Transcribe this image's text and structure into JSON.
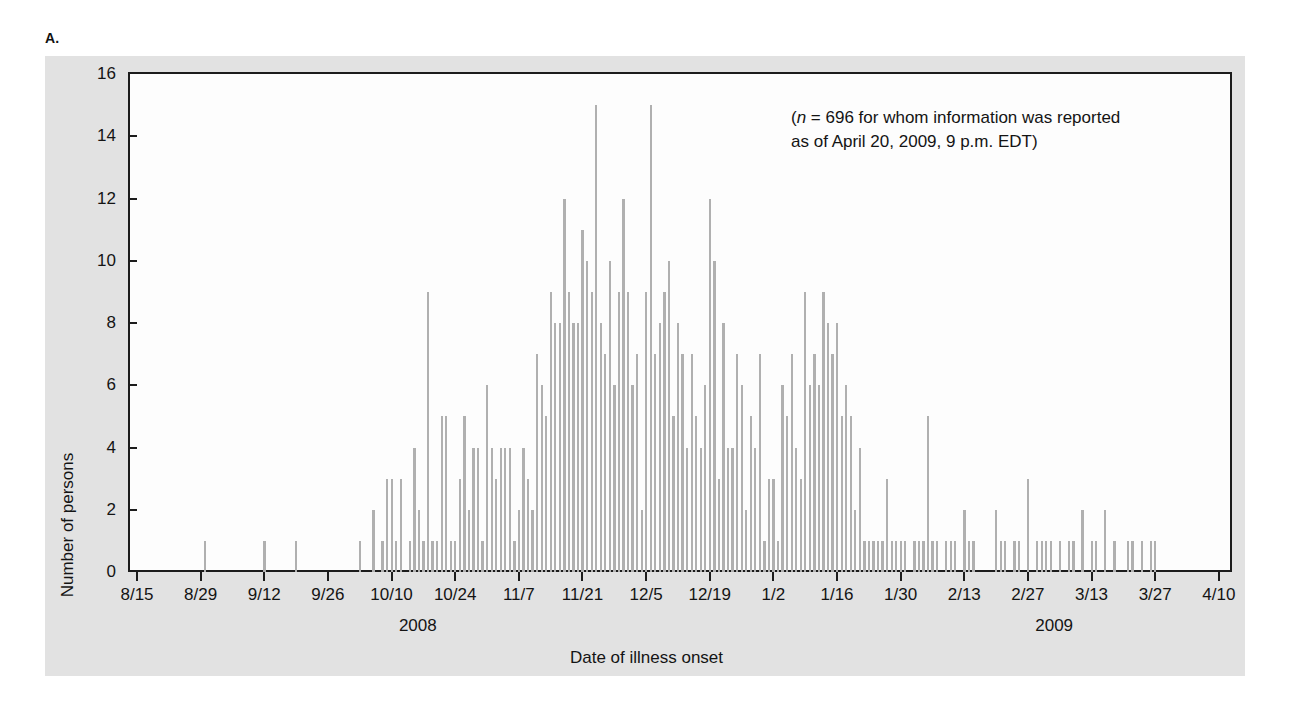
{
  "figure": {
    "panel_letter": "A.",
    "annotation_line1_prefix": "(",
    "annotation_n_symbol": "n",
    "annotation_line1_rest": " = 696 for whom information was reported",
    "annotation_line2": "as of April 20, 2009, 9 p.m. EDT)",
    "annotation_full": "(n = 696 for whom information was reported as of April 20, 2009, 9 p.m. EDT)",
    "plate_color": "#e2e2e2",
    "bar_color": "#b0b0b0",
    "axis_color": "#1c1c1c",
    "plot_background": "#fdfdfd"
  },
  "chart_data": {
    "type": "bar",
    "title": "",
    "subtitle": "",
    "xlabel": "Date of illness onset",
    "ylabel": "Number of persons",
    "ylim": [
      0,
      16
    ],
    "ytick_labels": [
      "0",
      "2",
      "4",
      "6",
      "8",
      "10",
      "12",
      "14",
      "16"
    ],
    "ytick_values": [
      0,
      2,
      4,
      6,
      8,
      10,
      12,
      14,
      16
    ],
    "grid": false,
    "legend": "none",
    "annotations": [
      {
        "text": "(n = 696 for whom information was reported as of April 20, 2009, 9 p.m. EDT)",
        "position": "top-right"
      }
    ],
    "x_axis": {
      "start_date": "8/15",
      "end_date": "4/10",
      "tick_interval_days": 14,
      "day_count": 240,
      "tick_labels": [
        "8/15",
        "8/29",
        "9/12",
        "9/26",
        "10/10",
        "10/24",
        "11/7",
        "11/21",
        "12/5",
        "12/19",
        "1/2",
        "1/16",
        "1/30",
        "2/13",
        "2/27",
        "3/13",
        "3/27",
        "4/10"
      ],
      "tick_day_offsets": [
        0,
        14,
        28,
        42,
        56,
        70,
        84,
        98,
        112,
        126,
        140,
        154,
        168,
        182,
        196,
        210,
        224,
        238
      ],
      "group_labels": [
        {
          "label": "2008",
          "center_day_offset": 62
        },
        {
          "label": "2009",
          "center_day_offset": 202
        }
      ]
    },
    "categories": [
      "8/15",
      "8/16",
      "8/17",
      "8/18",
      "8/19",
      "8/20",
      "8/21",
      "8/22",
      "8/23",
      "8/24",
      "8/25",
      "8/26",
      "8/27",
      "8/28",
      "8/29",
      "8/30",
      "8/31",
      "9/1",
      "9/2",
      "9/3",
      "9/4",
      "9/5",
      "9/6",
      "9/7",
      "9/8",
      "9/9",
      "9/10",
      "9/11",
      "9/12",
      "9/13",
      "9/14",
      "9/15",
      "9/16",
      "9/17",
      "9/18",
      "9/19",
      "9/20",
      "9/21",
      "9/22",
      "9/23",
      "9/24",
      "9/25",
      "9/26",
      "9/27",
      "9/28",
      "9/29",
      "9/30",
      "10/1",
      "10/2",
      "10/3",
      "10/4",
      "10/5",
      "10/6",
      "10/7",
      "10/8",
      "10/9",
      "10/10",
      "10/11",
      "10/12",
      "10/13",
      "10/14",
      "10/15",
      "10/16",
      "10/17",
      "10/18",
      "10/19",
      "10/20",
      "10/21",
      "10/22",
      "10/23",
      "10/24",
      "10/25",
      "10/26",
      "10/27",
      "10/28",
      "10/29",
      "10/30",
      "10/31",
      "11/1",
      "11/2",
      "11/3",
      "11/4",
      "11/5",
      "11/6",
      "11/7",
      "11/8",
      "11/9",
      "11/10",
      "11/11",
      "11/12",
      "11/13",
      "11/14",
      "11/15",
      "11/16",
      "11/17",
      "11/18",
      "11/19",
      "11/20",
      "11/21",
      "11/22",
      "11/23",
      "11/24",
      "11/25",
      "11/26",
      "11/27",
      "11/28",
      "11/29",
      "11/30",
      "12/1",
      "12/2",
      "12/3",
      "12/4",
      "12/5",
      "12/6",
      "12/7",
      "12/8",
      "12/9",
      "12/10",
      "12/11",
      "12/12",
      "12/13",
      "12/14",
      "12/15",
      "12/16",
      "12/17",
      "12/18",
      "12/19",
      "12/20",
      "12/21",
      "12/22",
      "12/23",
      "12/24",
      "12/25",
      "12/26",
      "12/27",
      "12/28",
      "12/29",
      "12/30",
      "12/31",
      "1/1",
      "1/2",
      "1/3",
      "1/4",
      "1/5",
      "1/6",
      "1/7",
      "1/8",
      "1/9",
      "1/10",
      "1/11",
      "1/12",
      "1/13",
      "1/14",
      "1/15",
      "1/16",
      "1/17",
      "1/18",
      "1/19",
      "1/20",
      "1/21",
      "1/22",
      "1/23",
      "1/24",
      "1/25",
      "1/26",
      "1/27",
      "1/28",
      "1/29",
      "1/30",
      "1/31",
      "2/1",
      "2/2",
      "2/3",
      "2/4",
      "2/5",
      "2/6",
      "2/7",
      "2/8",
      "2/9",
      "2/10",
      "2/11",
      "2/12",
      "2/13",
      "2/14",
      "2/15",
      "2/16",
      "2/17",
      "2/18",
      "2/19",
      "2/20",
      "2/21",
      "2/22",
      "2/23",
      "2/24",
      "2/25",
      "2/26",
      "2/27",
      "2/28",
      "3/1",
      "3/2",
      "3/3",
      "3/4",
      "3/5",
      "3/6",
      "3/7",
      "3/8",
      "3/9",
      "3/10",
      "3/11",
      "3/12",
      "3/13",
      "3/14",
      "3/15",
      "3/16",
      "3/17",
      "3/18",
      "3/19",
      "3/20",
      "3/21",
      "3/22",
      "3/23",
      "3/24",
      "3/25",
      "3/26",
      "3/27",
      "3/28",
      "3/29",
      "3/30",
      "3/31",
      "4/1",
      "4/2",
      "4/3",
      "4/4",
      "4/5",
      "4/6",
      "4/7",
      "4/8",
      "4/9",
      "4/10",
      "4/11"
    ],
    "values": [
      0,
      0,
      0,
      0,
      0,
      0,
      0,
      0,
      0,
      0,
      0,
      0,
      0,
      0,
      0,
      1,
      0,
      0,
      0,
      0,
      0,
      0,
      0,
      0,
      0,
      0,
      0,
      0,
      1,
      0,
      0,
      0,
      0,
      0,
      0,
      1,
      0,
      0,
      0,
      0,
      0,
      0,
      0,
      0,
      0,
      0,
      0,
      0,
      0,
      1,
      0,
      0,
      2,
      0,
      1,
      3,
      3,
      1,
      3,
      0,
      1,
      4,
      2,
      1,
      9,
      1,
      1,
      5,
      5,
      1,
      1,
      3,
      5,
      2,
      4,
      4,
      1,
      6,
      4,
      3,
      4,
      4,
      4,
      1,
      2,
      4,
      3,
      2,
      7,
      6,
      5,
      9,
      8,
      8,
      12,
      9,
      8,
      8,
      11,
      10,
      9,
      15,
      8,
      7,
      10,
      6,
      9,
      12,
      9,
      6,
      7,
      2,
      9,
      15,
      7,
      8,
      9,
      10,
      5,
      8,
      7,
      4,
      7,
      5,
      4,
      6,
      12,
      10,
      3,
      8,
      4,
      4,
      7,
      6,
      2,
      5,
      4,
      7,
      1,
      3,
      3,
      1,
      6,
      5,
      7,
      4,
      3,
      9,
      6,
      7,
      6,
      9,
      8,
      7,
      8,
      5,
      6,
      5,
      2,
      4,
      1,
      1,
      1,
      1,
      1,
      3,
      1,
      1,
      1,
      1,
      0,
      1,
      1,
      1,
      5,
      1,
      1,
      0,
      1,
      1,
      1,
      0,
      2,
      1,
      1,
      0,
      0,
      0,
      0,
      2,
      1,
      1,
      0,
      1,
      1,
      0,
      3,
      0,
      1,
      1,
      1,
      1,
      0,
      1,
      0,
      1,
      1,
      0,
      2,
      0,
      1,
      1,
      0,
      2,
      0,
      1,
      0,
      0,
      1,
      1,
      0,
      1,
      0,
      1,
      1,
      0,
      0,
      0,
      0,
      0,
      0,
      0,
      0,
      0,
      0,
      0,
      0,
      0,
      0,
      0
    ],
    "max_value": 15,
    "total_n": 696
  }
}
